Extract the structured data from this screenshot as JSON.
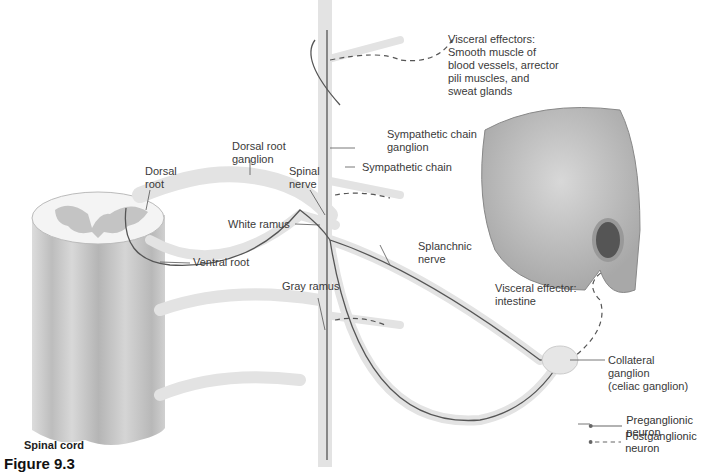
{
  "figure": {
    "label": "Figure 9.3",
    "title_label": "Spinal cord"
  },
  "labels": {
    "dorsal_root": "Dorsal\nroot",
    "dorsal_root_ganglion": "Dorsal root\nganglion",
    "spinal_nerve": "Spinal\nnerve",
    "white_ramus": "White ramus",
    "ventral_root": "Ventral root",
    "gray_ramus": "Gray ramus",
    "sympathetic_chain_ganglion": "Sympathetic chain\nganglion",
    "sympathetic_chain": "Sympathetic chain",
    "splanchnic_nerve": "Splanchnic\nnerve",
    "visceral_effectors_top": "Visceral effectors:\nSmooth muscle of\nblood vessels, arrector\npili muscles, and\nsweat glands",
    "visceral_effector_intestine": "Visceral effector:\nintestine",
    "collateral_ganglion": "Collateral\nganglion\n(celiac ganglion)"
  },
  "legend": [
    {
      "style": "solid",
      "label": "Preganglionic neuron"
    },
    {
      "style": "dashed",
      "label": "Postganglionic neuron"
    }
  ],
  "colors": {
    "nerve_fill": "#e6e6e6",
    "nerve_line": "#555555",
    "cord_fill": "#cfcfcf",
    "gray_matter": "#bdbdbd",
    "text": "#333333"
  }
}
